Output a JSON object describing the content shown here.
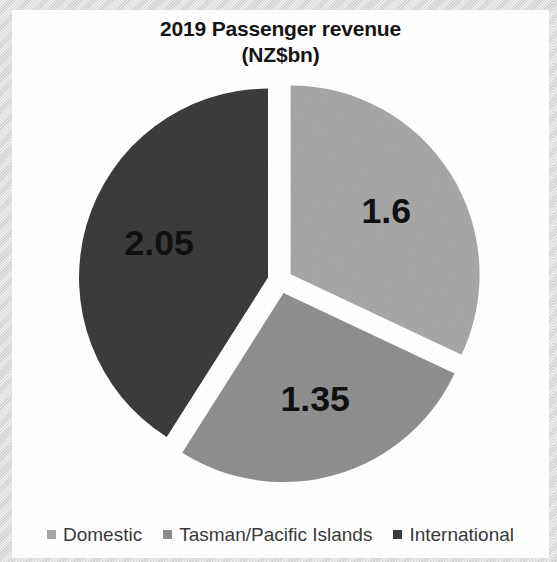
{
  "chart_data": {
    "type": "pie",
    "title": "2019 Passenger revenue (NZ$bn)",
    "title_lines": [
      "2019 Passenger revenue",
      "(NZ$bn)"
    ],
    "categories": [
      "Domestic",
      "Tasman/Pacific Islands",
      "International"
    ],
    "values": [
      1.6,
      1.35,
      2.05
    ],
    "data_labels": [
      "1.6",
      "1.35",
      "2.05"
    ],
    "unit": "NZ$bn",
    "year": "2019",
    "colors": [
      "#a6a6a6",
      "#8e8e8e",
      "#3b3b3b"
    ],
    "exploded": true,
    "legend_position": "bottom",
    "grid": false,
    "xlabel": "",
    "ylabel": "",
    "slices": [
      {
        "name": "Domestic",
        "value": 1.6,
        "label": "1.6",
        "color": "#a6a6a6"
      },
      {
        "name": "Tasman/Pacific Islands",
        "value": 1.35,
        "label": "1.35",
        "color": "#8e8e8e"
      },
      {
        "name": "International",
        "value": 2.05,
        "label": "2.05",
        "color": "#3b3b3b"
      }
    ]
  },
  "legend": {
    "items": [
      {
        "label": "Domestic",
        "color": "#a6a6a6"
      },
      {
        "label": "Tasman/Pacific Islands",
        "color": "#8e8e8e"
      },
      {
        "label": "International",
        "color": "#3b3b3b"
      }
    ]
  }
}
